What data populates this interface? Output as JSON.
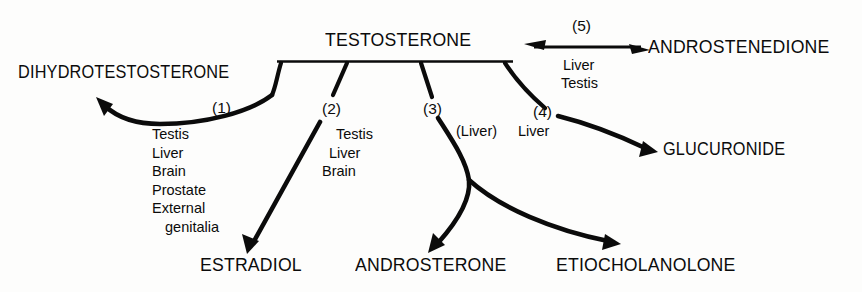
{
  "diagram": {
    "title": "TESTOSTERONE",
    "background_color": "#fdfdfc",
    "ink_color": "#0b0b0b",
    "source_node": {
      "label": "TESTOSTERONE",
      "has_underline_bar": true
    },
    "products": {
      "dihydrotestosterone": "DIHYDROTESTOSTERONE",
      "estradiol": "ESTRADIOL",
      "androsterone": "ANDROSTERONE",
      "etiocholanolone": "ETIOCHOLANOLONE",
      "glucuronide": "GLUCURONIDE",
      "androstenedione": "ANDROSTENEDIONE"
    },
    "pathways": [
      {
        "number": "(1)",
        "product": "DIHYDROTESTOSTERONE",
        "tissues": [
          "Testis",
          "Liver",
          "Brain",
          "Prostate",
          "External",
          "genitalia"
        ],
        "arrow": "curved-left-up",
        "reversible": false
      },
      {
        "number": "(2)",
        "product": "ESTRADIOL",
        "tissues": [
          "Testis",
          "Liver",
          "Brain"
        ],
        "arrow": "straight-down-left",
        "reversible": false
      },
      {
        "number": "(3)",
        "product": "ANDROSTERONE",
        "tissues": [
          "(Liver)"
        ],
        "arrow": "curved-down-forked",
        "reversible": false
      },
      {
        "number": "(3)",
        "product": "ETIOCHOLANOLONE",
        "tissues": [
          "(Liver)"
        ],
        "arrow": "curved-down-right",
        "reversible": false
      },
      {
        "number": "(4)",
        "product": "GLUCURONIDE",
        "tissues": [
          "Liver"
        ],
        "arrow": "curved-right",
        "reversible": false
      },
      {
        "number": "(5)",
        "product": "ANDROSTENEDIONE",
        "tissues": [
          "Liver",
          "Testis"
        ],
        "arrow": "double-headed-horizontal",
        "reversible": true
      }
    ],
    "step_labels": {
      "one": "(1)",
      "two": "(2)",
      "three": "(3)",
      "four": "(4)",
      "five": "(5)"
    },
    "tissue_labels": {
      "dht_list": [
        "Testis",
        "Liver",
        "Brain",
        "Prostate",
        "External",
        "genitalia"
      ],
      "estradiol_list": [
        "Testis",
        "Liver",
        "Brain"
      ],
      "three_liver": "(Liver)",
      "four_liver": "Liver",
      "five_liver": "Liver",
      "five_testis": "Testis"
    }
  }
}
